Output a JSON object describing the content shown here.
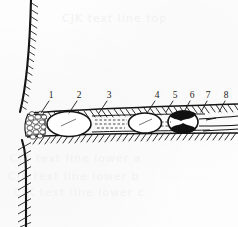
{
  "figure": {
    "kind": "labeled-cross-section-diagram",
    "title": "",
    "caption": "",
    "background_color": "#fdfdfd",
    "ink_color": "#1a1a1a",
    "fill_dark": "#111111",
    "fill_light": "#ffffff"
  },
  "callouts": {
    "labels": [
      "1",
      "2",
      "3",
      "4",
      "5",
      "6",
      "7",
      "8"
    ],
    "items": [
      {
        "label": "1",
        "text_x": 51,
        "text_y": 98,
        "line_x1": 49,
        "line_y1": 101,
        "line_x2": 41,
        "line_y2": 113
      },
      {
        "label": "2",
        "text_x": 79,
        "text_y": 98,
        "line_x1": 77,
        "line_y1": 101,
        "line_x2": 69,
        "line_y2": 113
      },
      {
        "label": "3",
        "text_x": 109,
        "text_y": 98,
        "line_x1": 107,
        "line_y1": 101,
        "line_x2": 99,
        "line_y2": 113
      },
      {
        "label": "4",
        "text_x": 157,
        "text_y": 98,
        "line_x1": 155,
        "line_y1": 101,
        "line_x2": 147,
        "line_y2": 113
      },
      {
        "label": "5",
        "text_x": 175,
        "text_y": 98,
        "line_x1": 173,
        "line_y1": 101,
        "line_x2": 166,
        "line_y2": 112
      },
      {
        "label": "6",
        "text_x": 192,
        "text_y": 98,
        "line_x1": 190,
        "line_y1": 101,
        "line_x2": 184,
        "line_y2": 112
      },
      {
        "label": "7",
        "text_x": 208,
        "text_y": 98,
        "line_x1": 207,
        "line_y1": 101,
        "line_x2": 201,
        "line_y2": 112
      },
      {
        "label": "8",
        "text_x": 226,
        "text_y": 98,
        "line_x1": 225,
        "line_y1": 101,
        "line_x2": 219,
        "line_y2": 112
      }
    ]
  },
  "structures": {
    "wall": {
      "name": "hatched-boundary-wall",
      "description": "curved vertical hatched wall at left"
    },
    "granular_zone": {
      "name": "granular-cobble-zone",
      "description": "pebbled/granular texture wedge adjoining the wall"
    },
    "channel": {
      "name": "horizontal-hatched-channel",
      "description": "tapering horizontal channel with hatched upper and lower margins"
    },
    "vesicles": [
      {
        "name": "open-vesicle-1",
        "cx": 69,
        "cy": 124,
        "rx": 22,
        "ry": 12.5,
        "fill": "#ffffff"
      },
      {
        "name": "open-vesicle-2",
        "cx": 145,
        "cy": 123,
        "rx": 16.5,
        "ry": 10,
        "fill": "#ffffff"
      },
      {
        "name": "dark-vesicle-3",
        "cx": 183,
        "cy": 122,
        "rx": 15,
        "ry": 11,
        "fill": "#111111"
      }
    ],
    "dashed_segments": [
      {
        "name": "dashed-line-a",
        "x1": 95,
        "y1": 120,
        "x2": 127,
        "y2": 120
      },
      {
        "name": "dashed-line-b",
        "x1": 95,
        "y1": 124,
        "x2": 127,
        "y2": 124
      },
      {
        "name": "dashed-line-c",
        "x1": 97,
        "y1": 128,
        "x2": 125,
        "y2": 128
      },
      {
        "name": "dashed-line-d",
        "x1": 160,
        "y1": 122,
        "x2": 171,
        "y2": 122
      },
      {
        "name": "dashed-line-e",
        "x1": 160,
        "y1": 126,
        "x2": 171,
        "y2": 126
      }
    ],
    "right_tail_lines": [
      {
        "name": "tail-line-top",
        "x1": 200,
        "y1": 119,
        "x2": 238,
        "y2": 117
      },
      {
        "name": "tail-line-middle",
        "x1": 200,
        "y1": 125,
        "x2": 238,
        "y2": 125
      },
      {
        "name": "tail-line-bottom",
        "x1": 203,
        "y1": 131,
        "x2": 238,
        "y2": 129
      }
    ]
  },
  "bleed_through": {
    "description": "faint show-through text from the reverse of the scanned page",
    "lines": [
      {
        "text": "CJK text line top",
        "x": 62,
        "y": 18,
        "size": 12
      },
      {
        "text": "CJK text line lower a",
        "x": 10,
        "y": 158,
        "size": 12
      },
      {
        "text": "CJK text line lower b",
        "x": 8,
        "y": 176,
        "size": 12
      },
      {
        "text": "CJK text line lower c",
        "x": 14,
        "y": 192,
        "size": 12
      }
    ]
  }
}
